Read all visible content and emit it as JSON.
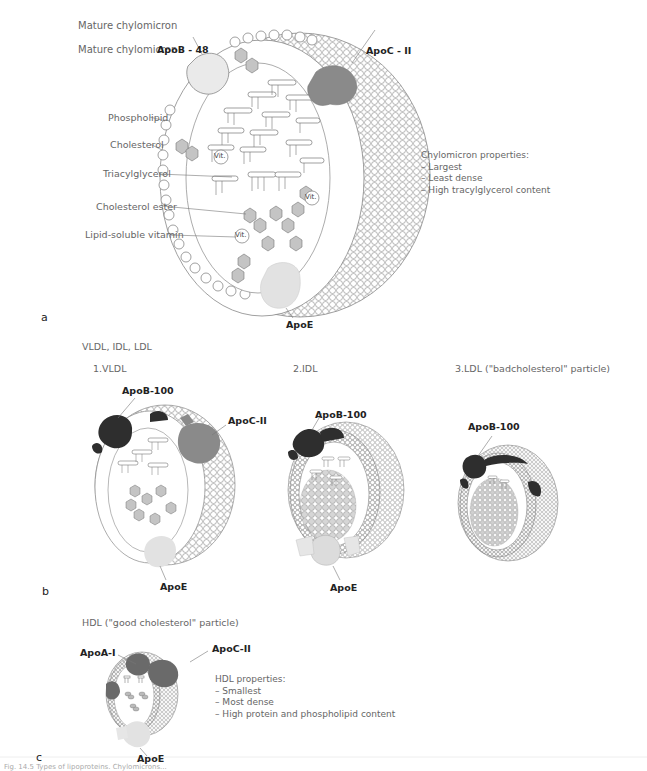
{
  "panel_a": {
    "panel_letter": "a",
    "title": "Mature chylomicron",
    "title_repeat": "Mature chylomicron",
    "labels": {
      "apob48": "ApoB - 48",
      "apocii": "ApoC - II",
      "phospholipid": "Phospholipid",
      "cholesterol": "Cholesterol",
      "triacylglycerol": "Triacylglycerol",
      "cholesterol_ester": "Cholesterol ester",
      "lipid_vitamin": "Lipid-soluble vitamin",
      "apoe": "ApoE",
      "vit": "Vit."
    },
    "properties": {
      "heading": "Chylomicron properties:",
      "items": [
        "– Largest",
        "– Least dense",
        "– High tracylglycerol content"
      ]
    }
  },
  "panel_b": {
    "panel_letter": "b",
    "title": "VLDL, IDL, LDL",
    "vldl": {
      "title": "1.VLDL",
      "apob": "ApoB-100",
      "apoc": "ApoC-II",
      "apoe": "ApoE"
    },
    "idl": {
      "title": "2.IDL",
      "apob": "ApoB-100",
      "apoe": "ApoE"
    },
    "ldl": {
      "title": "3.LDL (\"badcholesterol\" particle)",
      "apob": "ApoB-100"
    }
  },
  "panel_c": {
    "panel_letter": "c",
    "title": "HDL (\"good cholesterol\" particle)",
    "apoa": "ApoA-I",
    "apoc": "ApoC-II",
    "apoe": "ApoE",
    "properties": {
      "heading": "HDL properties:",
      "items": [
        "– Smallest",
        "– Most dense",
        "– High protein and phospholipid content"
      ]
    }
  },
  "caption": "Fig. 14.5 Types of lipoproteins. Chylomicrons..."
}
